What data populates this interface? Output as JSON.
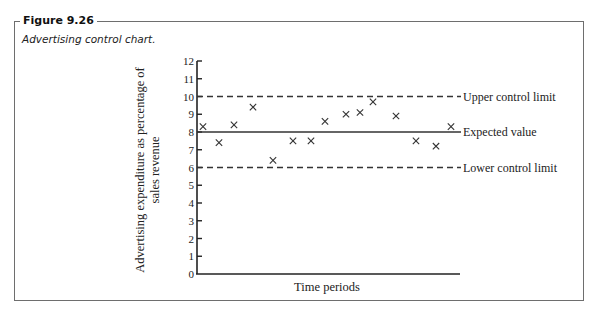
{
  "figure": {
    "label": "Figure 9.26",
    "caption": "Advertising control chart."
  },
  "chart_data": {
    "type": "scatter",
    "title": "Advertising control chart.",
    "xlabel": "Time periods",
    "ylabel_lines": [
      "Advertising expenditure as percentage of",
      "sales revenue"
    ],
    "ylim": [
      0,
      12
    ],
    "yticks": [
      0,
      1,
      2,
      3,
      4,
      5,
      6,
      7,
      8,
      9,
      10,
      11,
      12
    ],
    "grid": false,
    "x_ticks_labeled": false,
    "series": [
      {
        "name": "Observed advertising expenditure",
        "marker": "x",
        "x": [
          1,
          2,
          3,
          4,
          5,
          6,
          7,
          8,
          9,
          10,
          11,
          12,
          13,
          14,
          15
        ],
        "values": [
          8.3,
          7.4,
          8.4,
          9.4,
          6.4,
          7.5,
          7.5,
          8.6,
          9.0,
          9.1,
          9.7,
          8.9,
          7.5,
          7.2,
          8.3
        ]
      }
    ],
    "reference_lines": [
      {
        "name": "Upper control limit",
        "value": 10,
        "style": "dashed"
      },
      {
        "name": "Expected value",
        "value": 8,
        "style": "solid"
      },
      {
        "name": "Lower control limit",
        "value": 6,
        "style": "dashed"
      }
    ],
    "point_x_pixels": [
      203,
      219,
      234,
      253,
      273,
      293,
      311,
      325,
      346,
      360,
      373,
      396,
      416,
      436,
      451
    ]
  },
  "colors": {
    "axis": "#222222",
    "frame": "#6e6e6e",
    "text": "#222222"
  }
}
